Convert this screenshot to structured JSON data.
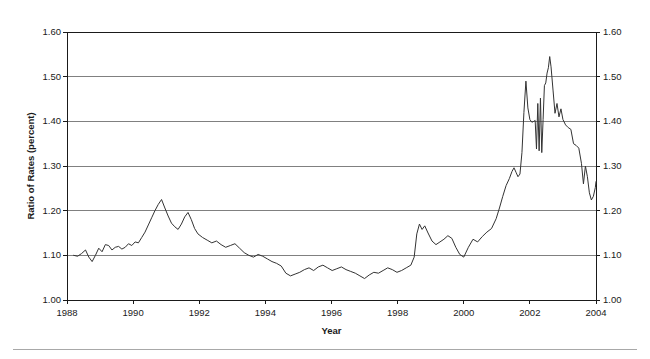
{
  "figure": {
    "background_color": "#ffffff",
    "line_color": "#333333",
    "grid_color": "#808080",
    "axis_color": "#1a1a1a",
    "rule_color": "#a8a8a8"
  },
  "chart_data": {
    "type": "line",
    "title": "",
    "xlabel": "Year",
    "ylabel": "Ratio of Rates (percent)",
    "xlim": [
      1988,
      2004
    ],
    "ylim": [
      1.0,
      1.6
    ],
    "grid": true,
    "grid_axis": "y",
    "legend": "none",
    "y_ticks": [
      "1.00",
      "1.10",
      "1.20",
      "1.30",
      "1.40",
      "1.50",
      "1.60"
    ],
    "y_tick_values": [
      1.0,
      1.1,
      1.2,
      1.3,
      1.4,
      1.5,
      1.6
    ],
    "y_axis_duplicated_right": true,
    "x_ticks": [
      "1988",
      "1990",
      "1992",
      "1994",
      "1996",
      "1998",
      "2000",
      "2002",
      "2004"
    ],
    "x_tick_values": [
      1988,
      1990,
      1992,
      1994,
      1996,
      1998,
      2000,
      2002,
      2004
    ],
    "series": [
      {
        "name": "Ratio of Rates",
        "x": [
          1988.2,
          1988.32,
          1988.44,
          1988.56,
          1988.66,
          1988.76,
          1988.86,
          1988.96,
          1989.06,
          1989.16,
          1989.26,
          1989.36,
          1989.46,
          1989.56,
          1989.66,
          1989.76,
          1989.86,
          1989.96,
          1990.06,
          1990.16,
          1990.26,
          1990.36,
          1990.46,
          1990.56,
          1990.66,
          1990.76,
          1990.86,
          1990.96,
          1991.06,
          1991.16,
          1991.26,
          1991.36,
          1991.46,
          1991.56,
          1991.66,
          1991.76,
          1991.86,
          1991.96,
          1992.1,
          1992.24,
          1992.38,
          1992.52,
          1992.66,
          1992.8,
          1992.94,
          1993.08,
          1993.22,
          1993.36,
          1993.5,
          1993.64,
          1993.78,
          1993.92,
          1994.06,
          1994.2,
          1994.34,
          1994.48,
          1994.62,
          1994.76,
          1994.9,
          1995.04,
          1995.18,
          1995.32,
          1995.46,
          1995.6,
          1995.74,
          1995.88,
          1996.02,
          1996.16,
          1996.3,
          1996.44,
          1996.58,
          1996.72,
          1996.86,
          1997.0,
          1997.14,
          1997.28,
          1997.42,
          1997.56,
          1997.7,
          1997.84,
          1997.98,
          1998.12,
          1998.26,
          1998.4,
          1998.5,
          1998.58,
          1998.66,
          1998.74,
          1998.82,
          1998.92,
          1999.04,
          1999.16,
          1999.28,
          1999.4,
          1999.52,
          1999.64,
          1999.76,
          1999.88,
          2000.0,
          2000.14,
          2000.28,
          2000.42,
          2000.56,
          2000.7,
          2000.84,
          2000.98,
          2001.08,
          2001.18,
          2001.28,
          2001.38,
          2001.46,
          2001.52,
          2001.58,
          2001.64,
          2001.7,
          2001.76,
          2001.82,
          2001.88,
          2001.94,
          2002.0,
          2002.06,
          2002.12,
          2002.16,
          2002.2,
          2002.24,
          2002.28,
          2002.32,
          2002.36,
          2002.4,
          2002.44,
          2002.48,
          2002.52,
          2002.56,
          2002.6,
          2002.64,
          2002.7,
          2002.76,
          2002.82,
          2002.88,
          2002.94,
          2003.0,
          2003.08,
          2003.16,
          2003.24,
          2003.32,
          2003.4,
          2003.48,
          2003.56,
          2003.62,
          2003.68,
          2003.74,
          2003.8,
          2003.86,
          2003.92,
          2003.98,
          2004.0
        ],
        "y": [
          1.1,
          1.098,
          1.104,
          1.112,
          1.096,
          1.086,
          1.1,
          1.116,
          1.108,
          1.124,
          1.122,
          1.112,
          1.118,
          1.12,
          1.114,
          1.118,
          1.126,
          1.122,
          1.13,
          1.128,
          1.14,
          1.152,
          1.168,
          1.184,
          1.2,
          1.214,
          1.225,
          1.206,
          1.188,
          1.172,
          1.164,
          1.158,
          1.17,
          1.186,
          1.196,
          1.18,
          1.16,
          1.148,
          1.14,
          1.134,
          1.128,
          1.132,
          1.124,
          1.118,
          1.122,
          1.126,
          1.116,
          1.106,
          1.1,
          1.096,
          1.102,
          1.098,
          1.092,
          1.086,
          1.082,
          1.076,
          1.06,
          1.054,
          1.058,
          1.062,
          1.068,
          1.072,
          1.066,
          1.074,
          1.078,
          1.072,
          1.066,
          1.07,
          1.074,
          1.068,
          1.064,
          1.06,
          1.054,
          1.048,
          1.056,
          1.062,
          1.06,
          1.066,
          1.072,
          1.068,
          1.062,
          1.066,
          1.072,
          1.078,
          1.096,
          1.148,
          1.17,
          1.158,
          1.166,
          1.15,
          1.132,
          1.124,
          1.13,
          1.136,
          1.144,
          1.138,
          1.118,
          1.102,
          1.096,
          1.118,
          1.136,
          1.13,
          1.142,
          1.152,
          1.16,
          1.182,
          1.206,
          1.232,
          1.256,
          1.272,
          1.288,
          1.296,
          1.286,
          1.276,
          1.282,
          1.33,
          1.42,
          1.49,
          1.43,
          1.404,
          1.398,
          1.4,
          1.402,
          1.338,
          1.44,
          1.334,
          1.452,
          1.33,
          1.404,
          1.48,
          1.486,
          1.508,
          1.52,
          1.545,
          1.522,
          1.47,
          1.418,
          1.44,
          1.41,
          1.428,
          1.404,
          1.392,
          1.386,
          1.382,
          1.35,
          1.346,
          1.34,
          1.306,
          1.26,
          1.3,
          1.276,
          1.24,
          1.224,
          1.232,
          1.252,
          1.265
        ]
      }
    ]
  }
}
